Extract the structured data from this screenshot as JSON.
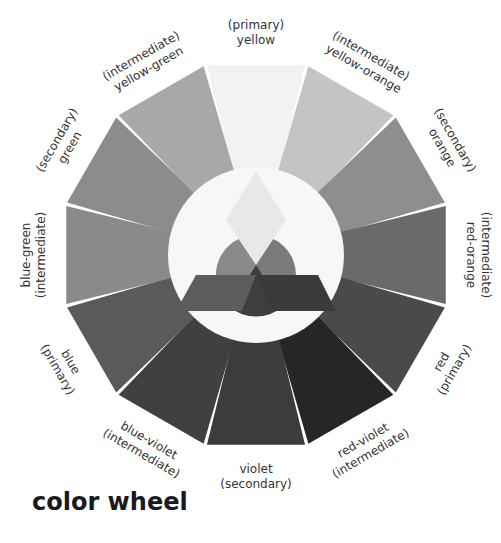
{
  "title": "color wheel",
  "center": {
    "x": 256,
    "y": 255
  },
  "radii": {
    "inner": 88,
    "outer": 196,
    "label": 214
  },
  "inner_circle_color": "#f7f7f7",
  "segments": [
    {
      "name": "yellow",
      "type": "(primary)",
      "color": "#f2f2f2",
      "angle": 0,
      "label_order": "type-first"
    },
    {
      "name": "yellow-orange",
      "type": "(intermediate)",
      "color": "#c4c4c4",
      "angle": 30,
      "label_order": "type-first"
    },
    {
      "name": "orange",
      "type": "(secondary)",
      "color": "#8e8e8e",
      "angle": 60,
      "label_order": "type-first"
    },
    {
      "name": "red-orange",
      "type": "(intermediate)",
      "color": "#6a6a6a",
      "angle": 90,
      "label_order": "type-first"
    },
    {
      "name": "red",
      "type": "(primary)",
      "color": "#4a4a4a",
      "angle": 120,
      "label_order": "name-first"
    },
    {
      "name": "red-violet",
      "type": "(intermediate)",
      "color": "#262626",
      "angle": 150,
      "label_order": "name-first"
    },
    {
      "name": "violet",
      "type": "(secondary)",
      "color": "#3c3c3c",
      "angle": 180,
      "label_order": "name-first"
    },
    {
      "name": "blue-violet",
      "type": "(intermediate)",
      "color": "#404040",
      "angle": 210,
      "label_order": "name-first"
    },
    {
      "name": "blue",
      "type": "(primary)",
      "color": "#5a5a5a",
      "angle": 240,
      "label_order": "name-first"
    },
    {
      "name": "blue-green",
      "type": "(intermediate)",
      "color": "#8a8a8a",
      "angle": 270,
      "label_order": "name-first"
    },
    {
      "name": "green",
      "type": "(secondary)",
      "color": "#8c8c8c",
      "angle": 300,
      "label_order": "type-first"
    },
    {
      "name": "yellow-green",
      "type": "(intermediate)",
      "color": "#a8a8a8",
      "angle": 330,
      "label_order": "type-first"
    }
  ],
  "center_shapes": {
    "primary_yellow_diamond": "#e8e8e8",
    "primary_red_trapezoid": "#3a3a3a",
    "primary_blue_trapezoid": "#5c5c5c",
    "secondary_green": "#8a8a8a",
    "secondary_orange": "#7a7a7a",
    "secondary_violet": "#3e3e3e"
  }
}
